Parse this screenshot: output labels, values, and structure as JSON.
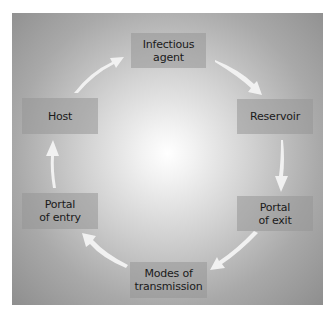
{
  "diagram": {
    "type": "cycle",
    "nodes": [
      {
        "id": "infectious-agent",
        "lines": [
          "Infectious",
          "agent"
        ]
      },
      {
        "id": "reservoir",
        "lines": [
          "Reservoir"
        ]
      },
      {
        "id": "portal-of-exit",
        "lines": [
          "Portal",
          "of exit"
        ]
      },
      {
        "id": "modes-of-transmission",
        "lines": [
          "Modes of",
          "transmission"
        ]
      },
      {
        "id": "portal-of-entry",
        "lines": [
          "Portal",
          "of entry"
        ]
      },
      {
        "id": "host",
        "lines": [
          "Host"
        ]
      }
    ],
    "edges": [
      {
        "from": "infectious-agent",
        "to": "reservoir"
      },
      {
        "from": "reservoir",
        "to": "portal-of-exit"
      },
      {
        "from": "portal-of-exit",
        "to": "modes-of-transmission"
      },
      {
        "from": "modes-of-transmission",
        "to": "portal-of-entry"
      },
      {
        "from": "portal-of-entry",
        "to": "host"
      },
      {
        "from": "host",
        "to": "infectious-agent"
      }
    ],
    "colors": {
      "background_center": "#ffffff",
      "background_edge": "#8e8e8e",
      "box_fill": "#a0a0a0",
      "arrow_fill": "#f4f4f4",
      "text": "#1a1a1a"
    }
  }
}
